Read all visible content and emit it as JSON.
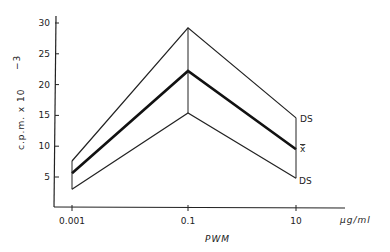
{
  "chart_data": {
    "type": "line",
    "title": "",
    "xlabel": "PWM",
    "x_unit": "µg/ml",
    "ylabel": "c.p.m. x 10^-3",
    "ylabel_display": "c.p.m.  x 10 −3",
    "x": [
      "0.001",
      "0.1",
      "10"
    ],
    "x_scale": "log",
    "yticks": [
      5,
      10,
      15,
      20,
      25,
      30
    ],
    "ylim": [
      0,
      31
    ],
    "grid": false,
    "legend": "inline labels at right end",
    "series": [
      {
        "name": "DS",
        "role": "upper (mean + SD)",
        "values": [
          7.6,
          29.2,
          14.6
        ],
        "stroke": "#222222",
        "width": 1.2
      },
      {
        "name": "x̄",
        "role": "mean",
        "values": [
          5.6,
          22.2,
          9.5
        ],
        "stroke": "#111111",
        "width": 2.6
      },
      {
        "name": "DS",
        "role": "lower (mean − SD)",
        "values": [
          3.0,
          15.4,
          4.8
        ],
        "stroke": "#222222",
        "width": 1.2
      }
    ],
    "vertical_connectors": true
  },
  "labels": {
    "upper": "DS",
    "mean": "x̄",
    "lower": "DS",
    "xlabel": "PWM",
    "x_unit": "µg/ml",
    "ylabel": "c.p.m.  x 10",
    "ylabel_exp": "−3"
  }
}
